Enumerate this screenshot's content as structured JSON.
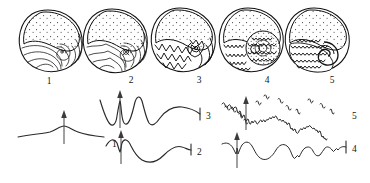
{
  "figure": {
    "background_color": "#ffffff",
    "ink_color": "#111111",
    "stages": [
      {
        "id": "stage-1",
        "label": "1",
        "suture_label": "1",
        "suture_type": "goniatitic-simple",
        "description": "Nautiloid-like shell with simple, nearly straight suture lines"
      },
      {
        "id": "stage-2",
        "label": "2",
        "suture_label": "2",
        "suture_type": "goniatitic",
        "description": "Shell with gently undulating sutures and a small median ventral lobe"
      },
      {
        "id": "stage-3",
        "label": "3",
        "suture_label": "3",
        "suture_type": "goniatitic-angular",
        "description": "Shell with sharply angular zig-zag sutures, pointed lobes and saddles"
      },
      {
        "id": "stage-4",
        "label": "4",
        "suture_label": "4",
        "suture_type": "ceratitic",
        "description": "Shell with rounded saddles and finely denticulate lobes"
      },
      {
        "id": "stage-5",
        "label": "5",
        "suture_label": "5",
        "suture_type": "ammonitic",
        "description": "Shell with highly frilled, fully subdivided ammonitic sutures"
      }
    ],
    "shell_labels": [
      "1",
      "2",
      "3",
      "4",
      "5"
    ],
    "suture_labels": [
      "1",
      "2",
      "3",
      "4",
      "5"
    ],
    "arrow_meaning": "venter / siphuncle direction arrow",
    "arrow_count": 5
  }
}
